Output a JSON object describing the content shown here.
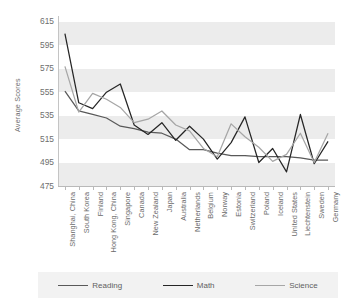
{
  "chart_data": {
    "type": "line",
    "title": "",
    "xlabel": "",
    "ylabel": "Average Scores",
    "ylim": [
      475,
      620
    ],
    "yticks": [
      475,
      495,
      515,
      535,
      555,
      575,
      595,
      615
    ],
    "grid": "horizontal-bands",
    "legend_position": "bottom",
    "categories": [
      "Shanghai, China",
      "South Korea",
      "Finland",
      "Hong Kong, China",
      "Singapore",
      "Canada",
      "New Zealand",
      "Japan",
      "Australia",
      "Netherlands",
      "Belgium",
      "Norway",
      "Estonia",
      "Switzerland",
      "Poland",
      "Iceland",
      "United States",
      "Liechtenstein",
      "Sweden",
      "Germany"
    ],
    "series": [
      {
        "name": "Reading",
        "color": "#595959",
        "values": [
          556,
          539,
          536,
          533,
          526,
          524,
          521,
          520,
          515,
          506,
          506,
          503,
          501,
          501,
          500,
          500,
          500,
          499,
          497,
          497
        ]
      },
      {
        "name": "Math",
        "color": "#262626",
        "values": [
          605,
          546,
          541,
          555,
          562,
          527,
          519,
          529,
          514,
          526,
          515,
          498,
          512,
          534,
          495,
          507,
          487,
          536,
          494,
          513
        ]
      },
      {
        "name": "Science",
        "color": "#a6a6a6",
        "values": [
          577,
          538,
          554,
          549,
          542,
          529,
          532,
          539,
          527,
          522,
          507,
          500,
          528,
          517,
          508,
          496,
          502,
          520,
          495,
          520
        ]
      }
    ]
  },
  "legend": {
    "items": [
      {
        "label": "Reading",
        "color": "#595959"
      },
      {
        "label": "Math",
        "color": "#262626"
      },
      {
        "label": "Science",
        "color": "#a6a6a6"
      }
    ]
  },
  "axes": {
    "y_title": "Average Scores"
  }
}
